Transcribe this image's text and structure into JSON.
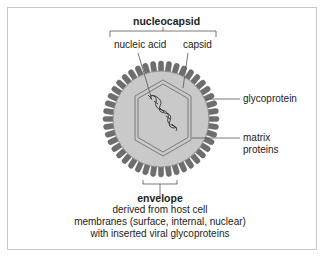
{
  "diagram": {
    "labels": {
      "nucleocapsid": "nucleocapsid",
      "nucleic_acid": "nucleic acid",
      "capsid": "capsid",
      "glycoprotein": "glycoprotein",
      "matrix_line1": "matrix",
      "matrix_line2": "proteins",
      "envelope": "envelope",
      "envelope_desc_line1": "derived  from host cell",
      "envelope_desc_line2": "membranes (surface, internal, nuclear)",
      "envelope_desc_line3": "with inserted viral glycoproteins"
    },
    "colors": {
      "frame": "#c8c8c8",
      "spike": "#6e6e6e",
      "spike_edge": "#555555",
      "envelope_disc": "#c9c9c9",
      "capsid_line": "#7a7a7a",
      "helix": "#333333",
      "leader_line": "#555555"
    },
    "geometry": {
      "center": [
        161,
        119
      ],
      "disc_radius": 47,
      "spike_length": 11,
      "spike_count": 44
    }
  }
}
